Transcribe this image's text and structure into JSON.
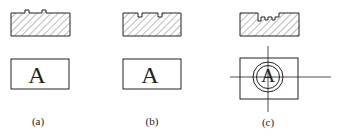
{
  "figure": {
    "panels": [
      {
        "id": "a",
        "label": "(a)",
        "letter": "A",
        "description": "flat plate with two small raised bumps on top surface"
      },
      {
        "id": "b",
        "label": "(b)",
        "letter": "A",
        "description": "plate with two small notches cut into top surface"
      },
      {
        "id": "c",
        "label": "(c)",
        "letter": "A",
        "description": "plate with stepped recess; plan view shows circled A with centerlines"
      }
    ]
  },
  "colors": {
    "line": "#222222",
    "hatch": "#555555",
    "background": "#ffffff"
  }
}
